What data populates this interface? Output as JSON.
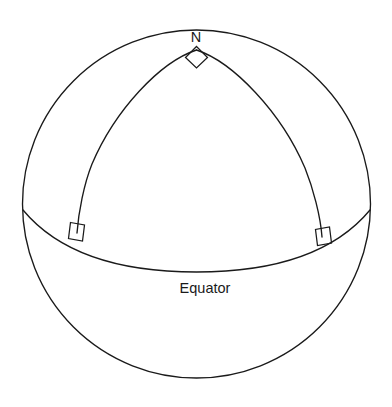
{
  "diagram": {
    "background_color": "#ffffff",
    "stroke_color": "#1a1a1a",
    "labels": {
      "north_pole": "N",
      "equator": "Equator"
    },
    "geometry": {
      "canvas": {
        "width": 392,
        "height": 407
      },
      "sphere_outline": {
        "cx": 196.5,
        "cy": 204,
        "r": 174
      },
      "north_pole_point": {
        "x": 196.5,
        "y": 48
      },
      "equator": {
        "left_end": {
          "x": 23,
          "y": 210
        },
        "right_end": {
          "x": 370,
          "y": 210
        },
        "lowest_point": {
          "x": 196.5,
          "y": 272
        }
      },
      "meridian_left_foot": {
        "x": 77,
        "y": 233
      },
      "meridian_right_foot": {
        "x": 322,
        "y": 237
      },
      "right_angle_marks": [
        {
          "name": "pole-right-angle",
          "x": 196.5,
          "y": 52
        },
        {
          "name": "left-foot-right-angle",
          "x": 77,
          "y": 233
        },
        {
          "name": "right-foot-right-angle",
          "x": 322,
          "y": 237
        }
      ]
    },
    "label_positions": {
      "north_pole": {
        "x": 196,
        "y": 42
      },
      "equator": {
        "x": 205,
        "y": 293
      }
    }
  }
}
